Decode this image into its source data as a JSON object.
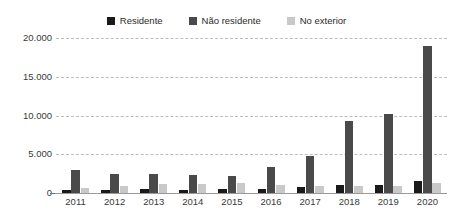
{
  "chart_data": {
    "type": "bar",
    "title": "",
    "subtitle": "",
    "xlabel": "",
    "ylabel": "",
    "categories": [
      "2011",
      "2012",
      "2013",
      "2014",
      "2015",
      "2016",
      "2017",
      "2018",
      "2019",
      "2020"
    ],
    "series": [
      {
        "name": "Residente",
        "color": "#1a1a1a",
        "values": [
          400,
          450,
          470,
          430,
          520,
          560,
          780,
          1050,
          1080,
          1550
        ]
      },
      {
        "name": "Não residente",
        "color": "#4a4a4a",
        "values": [
          2950,
          2400,
          2500,
          2350,
          2200,
          3300,
          4800,
          9300,
          10200,
          19000
        ]
      },
      {
        "name": "No exterior",
        "color": "#c9c9c9",
        "values": [
          600,
          900,
          1150,
          1200,
          1250,
          1000,
          950,
          950,
          930,
          1300
        ]
      }
    ],
    "ylim": [
      0,
      20000
    ],
    "yticks": [
      0,
      5000,
      10000,
      15000,
      20000
    ],
    "ytick_labels": [
      "0",
      "5.000",
      "10.000",
      "15.000",
      "20.000"
    ],
    "grid": true,
    "grid_style": "dashed-horizontal",
    "legend_position": "top-center",
    "legend_entries": [
      "Residente",
      "Não residente",
      "No exterior"
    ],
    "annotations": []
  },
  "legend": {
    "items": [
      {
        "label": "Residente",
        "swatch": "legend-swatch-residente"
      },
      {
        "label": "Não residente",
        "swatch": "legend-swatch-nao-residente"
      },
      {
        "label": "No exterior",
        "swatch": "legend-swatch-no-exterior"
      }
    ]
  },
  "colors": {
    "residente": "#1a1a1a",
    "nao_residente": "#4a4a4a",
    "no_exterior": "#c9c9c9",
    "gridline": "#bdbdbd",
    "axis": "#9a9a9a",
    "text": "#3a3a3a",
    "background": "#ffffff"
  }
}
